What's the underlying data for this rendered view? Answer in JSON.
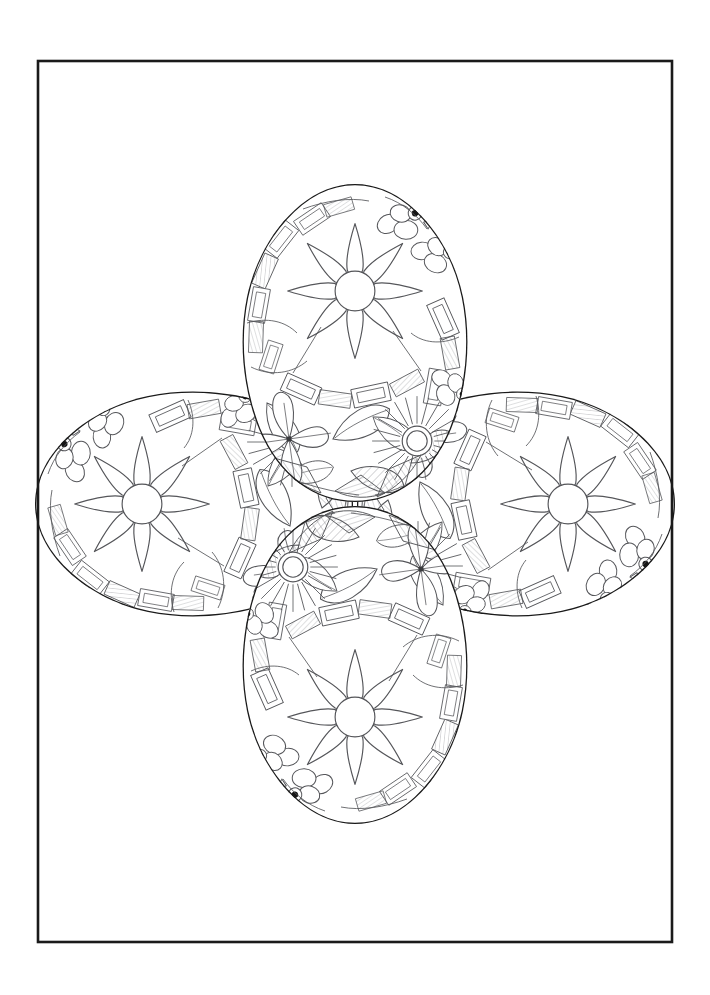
{
  "page": {
    "kind": "coloring-page",
    "background_color": "#ffffff",
    "width": 710,
    "height": 995
  },
  "frame": {
    "name": "page-border-frame",
    "x": 38,
    "y": 61,
    "width": 634,
    "height": 881,
    "stroke_color": "#1a1a1a",
    "stroke_width": 2.6,
    "fill": "none"
  },
  "composition": {
    "arrangement": "four-egg-cloverleaf",
    "center_x": 355,
    "center_y": 504,
    "egg_count": 4,
    "description": "Four decorated Easter eggs overlapping in a cross arrangement"
  },
  "eggs": [
    {
      "id": "egg-top",
      "label": "Top Egg",
      "orientation": "vertical-up",
      "center_x": 355,
      "center_y": 343,
      "rx": 112,
      "ry": 159,
      "rotation_deg": 0,
      "outline_stroke": "#1a1a1a",
      "outline_width": 2.4
    },
    {
      "id": "egg-bottom",
      "label": "Bottom Egg",
      "orientation": "vertical-down",
      "center_x": 355,
      "center_y": 665,
      "rx": 112,
      "ry": 159,
      "rotation_deg": 180,
      "outline_stroke": "#1a1a1a",
      "outline_width": 2.4
    },
    {
      "id": "egg-left",
      "label": "Left Egg",
      "orientation": "horizontal-left",
      "center_x": 194,
      "center_y": 504,
      "rx": 112,
      "ry": 159,
      "rotation_deg": 270,
      "outline_stroke": "#1a1a1a",
      "outline_width": 2.4
    },
    {
      "id": "egg-right",
      "label": "Right Egg",
      "orientation": "horizontal-right",
      "center_x": 516,
      "center_y": 504,
      "rx": 112,
      "ry": 159,
      "rotation_deg": 90,
      "outline_stroke": "#1a1a1a",
      "outline_width": 2.4
    }
  ],
  "pattern": {
    "line_color": "#55565a",
    "line_width": 1.1,
    "hatch_color": "#6a6b70",
    "hatch_width": 0.65,
    "dot_color": "#1a1a1a",
    "motifs": [
      {
        "name": "eight-petal-star-flower",
        "count": 1,
        "note": "large 8-pointed petal flower with plain circle center"
      },
      {
        "name": "sunburst-flower",
        "count": 1,
        "note": "double-ring center with radiating rays and broad petals"
      },
      {
        "name": "four-petal-sparkle-flower",
        "count": 1,
        "note": "four rounded petals with a cross sparkle at center"
      },
      {
        "name": "leaf-cluster",
        "count": 6,
        "note": "pointed leaves, some hatched"
      },
      {
        "name": "ribbon-band",
        "count": 8,
        "note": "rectangular banded strips along the egg rim"
      },
      {
        "name": "berry-cluster",
        "count": 3,
        "note": "rounded blobs with filled dark dot centers"
      },
      {
        "name": "hatched-fill",
        "count": 7,
        "note": "fine parallel line shading"
      }
    ]
  },
  "palette": {
    "paper": "#ffffff",
    "frame_ink": "#1a1a1a",
    "egg_outline_ink": "#1a1a1a",
    "detail_ink": "#55565a",
    "hatch_ink": "#6a6b70",
    "dot_ink": "#111111"
  }
}
